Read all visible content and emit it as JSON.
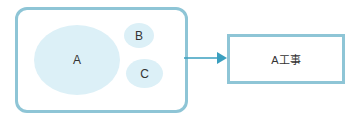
{
  "diagram": {
    "group": {
      "nodes": [
        {
          "id": "A",
          "label": "A"
        },
        {
          "id": "B",
          "label": "B"
        },
        {
          "id": "C",
          "label": "C"
        }
      ]
    },
    "target": {
      "label": "A工事"
    },
    "edge": {
      "from": "group",
      "to": "target",
      "type": "arrow"
    },
    "colors": {
      "border": "#8ec5d6",
      "ellipse_fill": "#dcf0f7",
      "arrow": "#3a9fbf"
    }
  }
}
